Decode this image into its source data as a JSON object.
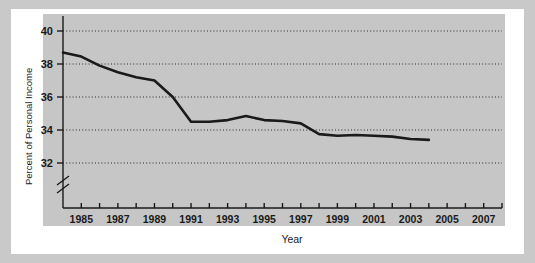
{
  "chart_data": {
    "type": "line",
    "title": "",
    "xlabel": "Year",
    "ylabel": "Percent of Personal Income",
    "xlim": [
      1984,
      2008
    ],
    "ylim": [
      31.0,
      40.5
    ],
    "y_axis_break": true,
    "grid": true,
    "legend": null,
    "ytick_labels": [
      "32",
      "34",
      "36",
      "38",
      "40"
    ],
    "ytick_values": [
      32,
      34,
      36,
      38,
      40
    ],
    "xtick_values": [
      1984,
      1985,
      1986,
      1987,
      1988,
      1989,
      1990,
      1991,
      1992,
      1993,
      1994,
      1995,
      1996,
      1997,
      1998,
      1999,
      2000,
      2001,
      2002,
      2003,
      2004,
      2005,
      2006,
      2007,
      2008
    ],
    "xtick_labels": [
      "1985",
      "1987",
      "1989",
      "1991",
      "1993",
      "1995",
      "1997",
      "1999",
      "2001",
      "2003",
      "2005",
      "2007"
    ],
    "xtick_labeled_values": [
      1985,
      1987,
      1989,
      1991,
      1993,
      1995,
      1997,
      1999,
      2001,
      2003,
      2005,
      2007
    ],
    "series": [
      {
        "name": "Percent of Personal Income",
        "color": "#1a1a1a",
        "x": [
          1984,
          1985,
          1986,
          1987,
          1988,
          1989,
          1990,
          1991,
          1992,
          1993,
          1994,
          1995,
          1996,
          1997,
          1998,
          1999,
          2000,
          2001,
          2002,
          2003,
          2004
        ],
        "values": [
          38.7,
          38.45,
          37.9,
          37.5,
          37.2,
          37.0,
          36.0,
          34.5,
          34.5,
          34.6,
          34.85,
          34.6,
          34.55,
          34.4,
          33.75,
          33.65,
          33.7,
          33.65,
          33.6,
          33.45,
          33.4
        ]
      }
    ]
  },
  "colors": {
    "page_background": "#c9c9c9",
    "frame": "#ffffff",
    "plot_background": "#c6c6c6",
    "line": "#1a1a1a",
    "grid": "#2b2b2b",
    "axis": "#1a1a1a"
  }
}
